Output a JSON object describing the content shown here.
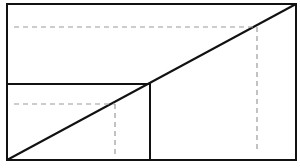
{
  "diagram": {
    "type": "geometric-similar-rectangles",
    "colors": {
      "stroke": "#111111",
      "guide": "#9a9a9a",
      "background": "#ffffff"
    },
    "outer_rect": {
      "x1": 7,
      "y1": 4,
      "x2": 296,
      "y2": 160
    },
    "inner_rect": {
      "x1": 7,
      "y1": 84,
      "x2": 150,
      "y2": 160
    },
    "diagonal": {
      "x1": 7,
      "y1": 160,
      "x2": 296,
      "y2": 4
    },
    "outer_guides": {
      "horizontal": {
        "x1": 14,
        "y1": 27,
        "x2": 257,
        "y2": 27
      },
      "vertical": {
        "x1": 257,
        "y1": 27,
        "x2": 257,
        "y2": 152
      }
    },
    "inner_guides": {
      "horizontal": {
        "x1": 14,
        "y1": 104,
        "x2": 115,
        "y2": 104
      },
      "vertical": {
        "x1": 115,
        "y1": 104,
        "x2": 115,
        "y2": 157
      }
    }
  }
}
